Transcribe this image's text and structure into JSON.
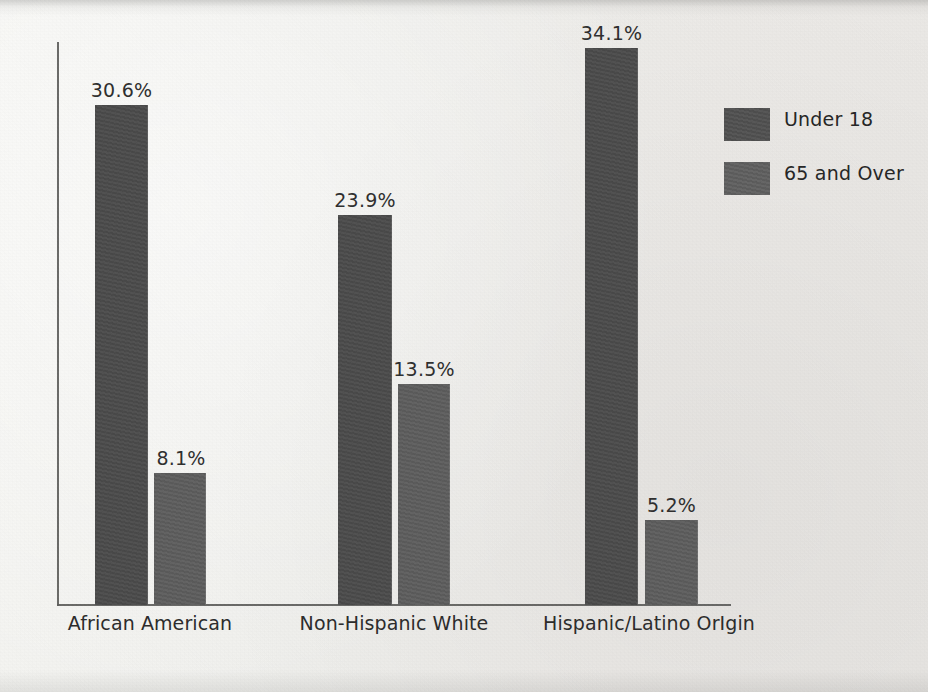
{
  "chart_data": {
    "type": "bar",
    "title": "",
    "subtitle": "",
    "xlabel": "",
    "ylabel": "",
    "ylim": [
      0,
      34.1
    ],
    "grid": false,
    "legend_position": "right",
    "categories": [
      "African American",
      "Non-Hispanic White",
      "Hispanic/Latino OrIgin"
    ],
    "series": [
      {
        "name": "Under 18",
        "color": "#4a4a4a",
        "values": [
          30.6,
          23.9,
          34.1
        ],
        "labels": [
          "30.6%",
          "23.9%",
          "34.1%"
        ]
      },
      {
        "name": "65 and Over",
        "color": "#5c5c5c",
        "values": [
          8.1,
          13.5,
          5.2
        ],
        "labels": [
          "8.1%",
          "13.5%",
          "5.2%"
        ]
      }
    ]
  },
  "legend": {
    "items": [
      {
        "label": "Under 18",
        "swatch": "legend-swatch-under-18"
      },
      {
        "label": "65 and Over",
        "swatch": "legend-swatch-65-and-over"
      }
    ]
  },
  "axes": {
    "x_axis_name": "category-axis",
    "y_axis_name": "value-axis"
  }
}
